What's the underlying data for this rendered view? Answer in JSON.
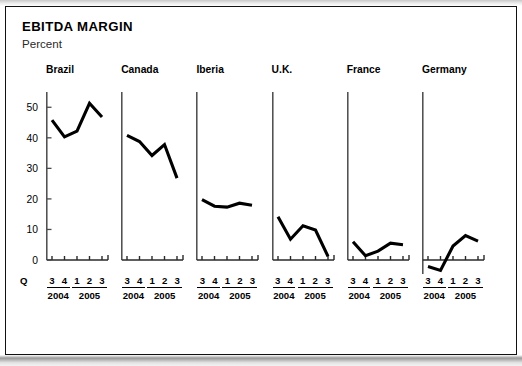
{
  "header": {
    "title": "EBITDA MARGIN",
    "subtitle": "Percent",
    "q_axis_label": "Q"
  },
  "chart_data": {
    "type": "line",
    "title": "EBITDA MARGIN",
    "subtitle": "Percent",
    "ylabel": "Percent",
    "xlabel": "Q",
    "grid": false,
    "legend": "none",
    "layout": "small-multiples, 6 panels side by side, shared y scale",
    "x": [
      "3",
      "4",
      "1",
      "2",
      "3"
    ],
    "x_tick_labels": [
      "3",
      "4",
      "1",
      "2",
      "3"
    ],
    "year_groups": [
      {
        "year": "2004",
        "quarters": [
          "3",
          "4"
        ]
      },
      {
        "year": "2005",
        "quarters": [
          "1",
          "2",
          "3"
        ]
      }
    ],
    "ylim": [
      0,
      55
    ],
    "y_ticks": [
      0,
      10,
      20,
      30,
      40,
      50
    ],
    "y_tick_labels": [
      "0",
      "10",
      "20",
      "30",
      "40",
      "50"
    ],
    "series": [
      {
        "name": "Brazil",
        "values": [
          45.8,
          40.3,
          42.2,
          51.3,
          46.8
        ]
      },
      {
        "name": "Canada",
        "values": [
          40.8,
          38.8,
          34.2,
          37.8,
          26.8
        ]
      },
      {
        "name": "Iberia",
        "values": [
          19.8,
          17.6,
          17.3,
          18.6,
          17.9
        ]
      },
      {
        "name": "U.K.",
        "values": [
          14.2,
          6.8,
          11.2,
          9.8,
          1.2
        ]
      },
      {
        "name": "France",
        "values": [
          6.0,
          1.4,
          2.9,
          5.5,
          5.0
        ]
      },
      {
        "name": "Germany",
        "values": [
          -2.1,
          -3.4,
          4.6,
          8.0,
          6.2
        ]
      }
    ]
  }
}
